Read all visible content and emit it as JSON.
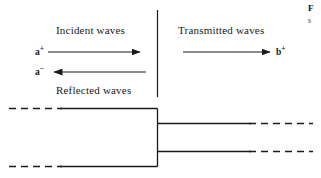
{
  "figure": {
    "labels": {
      "incident": "Incident waves",
      "transmitted": "Transmitted waves",
      "reflected": "Reflected waves"
    },
    "amplitudes": {
      "incident": {
        "base": "a",
        "sign": "+"
      },
      "reflected": {
        "base": "a",
        "sign": "−"
      },
      "transmitted": {
        "base": "b",
        "sign": "+"
      }
    },
    "caption": {
      "line1": "F",
      "line2": "s"
    },
    "colors": {
      "line": "#1a1a1a",
      "text": "#1a1a1a",
      "background": "#ffffff"
    },
    "geometry": {
      "divider": {
        "x": 157,
        "y1": 10,
        "y2": 97
      },
      "arrows": [
        {
          "name": "incident-arrow",
          "x1": 48,
          "y1": 52,
          "x2": 142,
          "y2": 52,
          "direction": "right"
        },
        {
          "name": "reflected-arrow",
          "x1": 146,
          "y1": 72,
          "x2": 52,
          "y2": 72,
          "direction": "left"
        },
        {
          "name": "transmitted-arrow",
          "x1": 183,
          "y1": 52,
          "x2": 272,
          "y2": 52,
          "direction": "right"
        }
      ],
      "waveguide": {
        "wide_top_y": 108,
        "wide_bottom_y": 166,
        "narrow_top_y": 123,
        "narrow_bottom_y": 151,
        "step_x": 157,
        "left_dash_start_x": 9,
        "left_solid_start_x": 62,
        "right_solid_end_x": 251,
        "right_dash_end_x": 313
      }
    }
  }
}
